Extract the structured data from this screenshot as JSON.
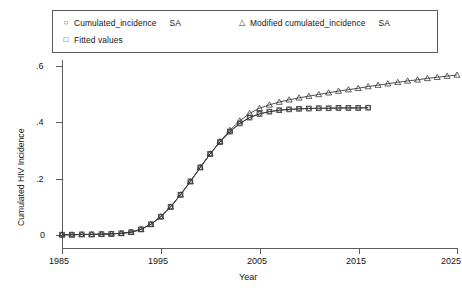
{
  "chart_data": {
    "type": "line",
    "title": "",
    "xlabel": "Year",
    "ylabel": "Cumulated HIV Incidence",
    "xlim": [
      1985,
      2026
    ],
    "ylim": [
      -0.02,
      0.63
    ],
    "xticks": [
      1985,
      1995,
      2005,
      2015,
      2025
    ],
    "xtick_labels": [
      "1985",
      "1995",
      "2005",
      "2015",
      "2025"
    ],
    "yticks": [
      0,
      0.2,
      0.4,
      0.6
    ],
    "ytick_labels": [
      "0",
      ".2",
      ".4",
      ".6"
    ],
    "grid": false,
    "legend_position": "top",
    "series": [
      {
        "name": "Cumulated_incidence SA",
        "marker": "circle",
        "x": [
          1985,
          1986,
          1987,
          1988,
          1989,
          1990,
          1991,
          1992,
          1993,
          1994,
          1995,
          1996,
          1997,
          1998,
          1999,
          2000,
          2001,
          2002,
          2003,
          2004,
          2005,
          2006,
          2007,
          2008,
          2009,
          2010,
          2011,
          2012,
          2013,
          2014,
          2015,
          2016
        ],
        "values": [
          0.001,
          0.001,
          0.002,
          0.002,
          0.003,
          0.004,
          0.006,
          0.01,
          0.02,
          0.038,
          0.065,
          0.1,
          0.143,
          0.19,
          0.24,
          0.288,
          0.33,
          0.367,
          0.396,
          0.417,
          0.43,
          0.438,
          0.443,
          0.446,
          0.448,
          0.449,
          0.45,
          0.45,
          0.451,
          0.451,
          0.451,
          0.452
        ]
      },
      {
        "name": "Fitted values",
        "marker": "square",
        "x": [
          1985,
          1986,
          1987,
          1988,
          1989,
          1990,
          1991,
          1992,
          1993,
          1994,
          1995,
          1996,
          1997,
          1998,
          1999,
          2000,
          2001,
          2002,
          2003,
          2004,
          2005,
          2006,
          2007,
          2008,
          2009,
          2010,
          2011,
          2012,
          2013,
          2014,
          2015,
          2016
        ],
        "values": [
          0.001,
          0.001,
          0.002,
          0.002,
          0.003,
          0.004,
          0.006,
          0.01,
          0.02,
          0.038,
          0.065,
          0.1,
          0.143,
          0.19,
          0.24,
          0.288,
          0.33,
          0.367,
          0.396,
          0.417,
          0.43,
          0.438,
          0.443,
          0.446,
          0.448,
          0.449,
          0.45,
          0.45,
          0.451,
          0.451,
          0.451,
          0.452
        ]
      },
      {
        "name": "Modified cumulated_incidence SA",
        "marker": "triangle",
        "x": [
          1985,
          1986,
          1987,
          1988,
          1989,
          1990,
          1991,
          1992,
          1993,
          1994,
          1995,
          1996,
          1997,
          1998,
          1999,
          2000,
          2001,
          2002,
          2003,
          2004,
          2005,
          2006,
          2007,
          2008,
          2009,
          2010,
          2011,
          2012,
          2013,
          2014,
          2015,
          2016,
          2017,
          2018,
          2019,
          2020,
          2021,
          2022,
          2023,
          2024,
          2025
        ],
        "values": [
          0.001,
          0.001,
          0.002,
          0.002,
          0.003,
          0.004,
          0.006,
          0.01,
          0.02,
          0.038,
          0.065,
          0.1,
          0.143,
          0.19,
          0.24,
          0.288,
          0.332,
          0.372,
          0.405,
          0.432,
          0.45,
          0.462,
          0.472,
          0.48,
          0.487,
          0.493,
          0.499,
          0.505,
          0.511,
          0.516,
          0.521,
          0.527,
          0.532,
          0.537,
          0.542,
          0.547,
          0.551,
          0.556,
          0.56,
          0.564,
          0.568
        ]
      }
    ]
  },
  "legend": {
    "items": [
      {
        "marker_glyph": "○",
        "marker_name": "circle-marker",
        "label": "Cumulated_incidence",
        "suffix": "SA"
      },
      {
        "marker_glyph": "□",
        "marker_name": "square-marker",
        "label": "Fitted values",
        "suffix": ""
      },
      {
        "marker_glyph": "△",
        "marker_name": "triangle-marker",
        "label": "Modified  cumulated_incidence",
        "suffix": "SA"
      }
    ]
  },
  "axes": {
    "y_title": "Cumulated HIV Incidence",
    "x_title": "Year",
    "y_ticks": [
      "0",
      ".2",
      ".4",
      ".6"
    ],
    "x_ticks": [
      "1985",
      "1995",
      "2005",
      "2015",
      "2025"
    ]
  },
  "colors": {
    "line": "#3a3a3a",
    "axis": "#5c5c5c",
    "text": "#141414",
    "background": "#ffffff"
  }
}
